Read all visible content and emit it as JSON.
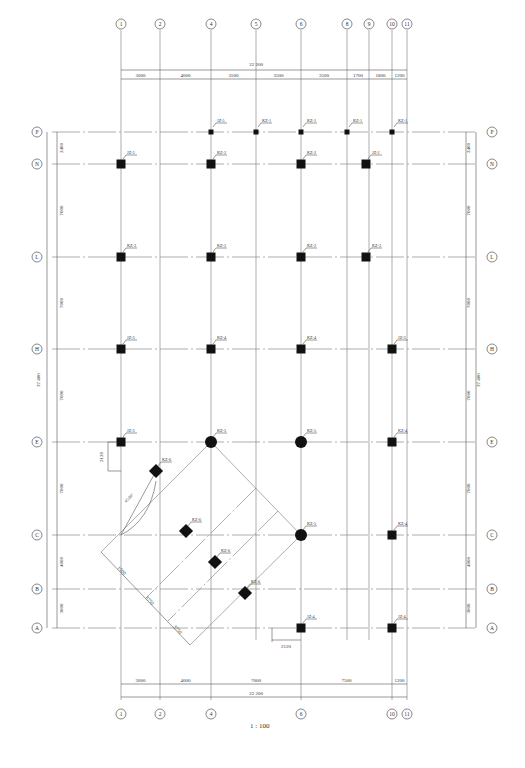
{
  "drawing": {
    "title": "Column Layout Plan",
    "scale_label": "1 : 100",
    "total_width": "22 200",
    "total_height": "37 400",
    "x_axes": [
      {
        "id": "1",
        "x": 121
      },
      {
        "id": "2",
        "x": 160
      },
      {
        "id": "4",
        "x": 211
      },
      {
        "id": "5",
        "x": 256
      },
      {
        "id": "6",
        "x": 301
      },
      {
        "id": "8",
        "x": 347
      },
      {
        "id": "9",
        "x": 369
      },
      {
        "id": "10",
        "x": 392
      },
      {
        "id": "11",
        "x": 407
      }
    ],
    "x_axes_bottom": [
      "1",
      "2",
      "4",
      "6",
      "10",
      "11"
    ],
    "y_axes": [
      {
        "id": "P",
        "y": 132
      },
      {
        "id": "N",
        "y": 164
      },
      {
        "id": "L",
        "y": 257
      },
      {
        "id": "H",
        "y": 349
      },
      {
        "id": "E",
        "y": 442
      },
      {
        "id": "C",
        "y": 535
      },
      {
        "id": "B",
        "y": 589
      },
      {
        "id": "A",
        "y": 628
      }
    ],
    "top_dims": [
      "3000",
      "4000",
      "3500",
      "3500",
      "3500",
      "1700",
      "1800",
      "1200"
    ],
    "bottom_dims": [
      "3000",
      "4000",
      "7000",
      "7500",
      "1200"
    ],
    "left_dims": [
      "2400",
      "7000",
      "7000",
      "7000",
      "7000",
      "4000",
      "3000"
    ],
    "right_dims": [
      "2400",
      "7000",
      "7000",
      "7000",
      "7000",
      "4000",
      "3000"
    ],
    "columns": [
      {
        "label": "JZ-5",
        "x": 211,
        "y": 132,
        "shape": "sq",
        "size": 5
      },
      {
        "label": "KZ-1",
        "x": 256,
        "y": 132,
        "shape": "sq",
        "size": 5
      },
      {
        "label": "KZ-1",
        "x": 301,
        "y": 132,
        "shape": "sq",
        "size": 5
      },
      {
        "label": "KZ-1",
        "x": 347,
        "y": 132,
        "shape": "sq",
        "size": 5
      },
      {
        "label": "KZ-1",
        "x": 392,
        "y": 132,
        "shape": "sq",
        "size": 5
      },
      {
        "label": "JZ-3",
        "x": 121,
        "y": 164,
        "shape": "sq",
        "size": 7
      },
      {
        "label": "KZ-2",
        "x": 211,
        "y": 164,
        "shape": "sq",
        "size": 7
      },
      {
        "label": "KZ-2",
        "x": 301,
        "y": 164,
        "shape": "sq",
        "size": 7
      },
      {
        "label": "JZ-2",
        "x": 366,
        "y": 164,
        "shape": "sq",
        "size": 7
      },
      {
        "label": "KZ-3",
        "x": 121,
        "y": 257,
        "shape": "sq",
        "size": 7
      },
      {
        "label": "KZ-2",
        "x": 211,
        "y": 257,
        "shape": "sq",
        "size": 7
      },
      {
        "label": "KZ-2",
        "x": 301,
        "y": 257,
        "shape": "sq",
        "size": 7
      },
      {
        "label": "KZ-3",
        "x": 366,
        "y": 257,
        "shape": "sq",
        "size": 7
      },
      {
        "label": "JZ-3",
        "x": 121,
        "y": 349,
        "shape": "sq",
        "size": 7
      },
      {
        "label": "KZ-4",
        "x": 211,
        "y": 349,
        "shape": "sq",
        "size": 7
      },
      {
        "label": "KZ-4",
        "x": 301,
        "y": 349,
        "shape": "sq",
        "size": 7
      },
      {
        "label": "JZ-3",
        "x": 392,
        "y": 349,
        "shape": "sq",
        "size": 7
      },
      {
        "label": "JZ-3",
        "x": 121,
        "y": 442,
        "shape": "sq",
        "size": 7
      },
      {
        "label": "KZ-5",
        "x": 211,
        "y": 442,
        "shape": "ci",
        "size": 5
      },
      {
        "label": "KZ-5",
        "x": 301,
        "y": 442,
        "shape": "ci",
        "size": 5
      },
      {
        "label": "KZ-4",
        "x": 392,
        "y": 442,
        "shape": "sq",
        "size": 7
      },
      {
        "label": "KZ-5",
        "x": 301,
        "y": 535,
        "shape": "ci",
        "size": 5
      },
      {
        "label": "KZ-4",
        "x": 392,
        "y": 535,
        "shape": "sq",
        "size": 7
      },
      {
        "label": "JZ-4",
        "x": 301,
        "y": 628,
        "shape": "sq",
        "size": 7
      },
      {
        "label": "JZ-4",
        "x": 392,
        "y": 628,
        "shape": "sq",
        "size": 7
      },
      {
        "label": "KZ-6",
        "x": 156,
        "y": 471,
        "shape": "di",
        "size": 5
      },
      {
        "label": "KZ-6",
        "x": 186,
        "y": 531,
        "shape": "di",
        "size": 5
      },
      {
        "label": "KZ-6",
        "x": 215,
        "y": 562,
        "shape": "di",
        "size": 5
      },
      {
        "label": "KZ-6",
        "x": 245,
        "y": 593,
        "shape": "di",
        "size": 5
      }
    ],
    "annotations": {
      "angle": "45.00°",
      "offset_left": "2120",
      "offset_bottom": "2120",
      "skew_dims": [
        "1500",
        "3750",
        "3750"
      ],
      "col_dims": [
        "400",
        "300",
        "300",
        "350",
        "350",
        "400"
      ]
    }
  }
}
